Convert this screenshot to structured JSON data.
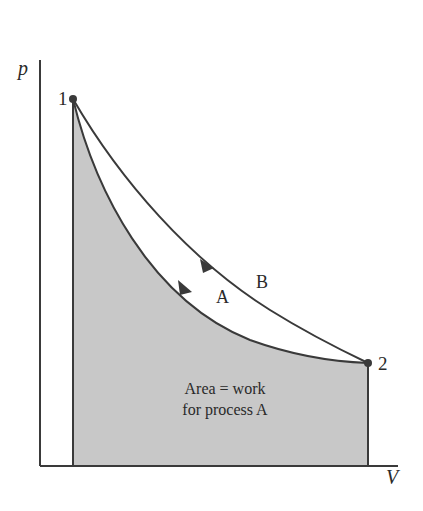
{
  "diagram": {
    "type": "p-V diagram",
    "axes": {
      "y_label": "p",
      "x_label": "V"
    },
    "states": [
      {
        "label": "1"
      },
      {
        "label": "2"
      }
    ],
    "processes": [
      {
        "label": "A",
        "description": "lower curve from 1 to 2"
      },
      {
        "label": "B",
        "description": "upper curve from 1 to 2"
      }
    ],
    "area_annotation": {
      "line1": "Area = work",
      "line2": "for process A"
    },
    "colors": {
      "shade": "#c8c8c8",
      "line": "#3a3a3a",
      "background": "#ffffff"
    }
  }
}
